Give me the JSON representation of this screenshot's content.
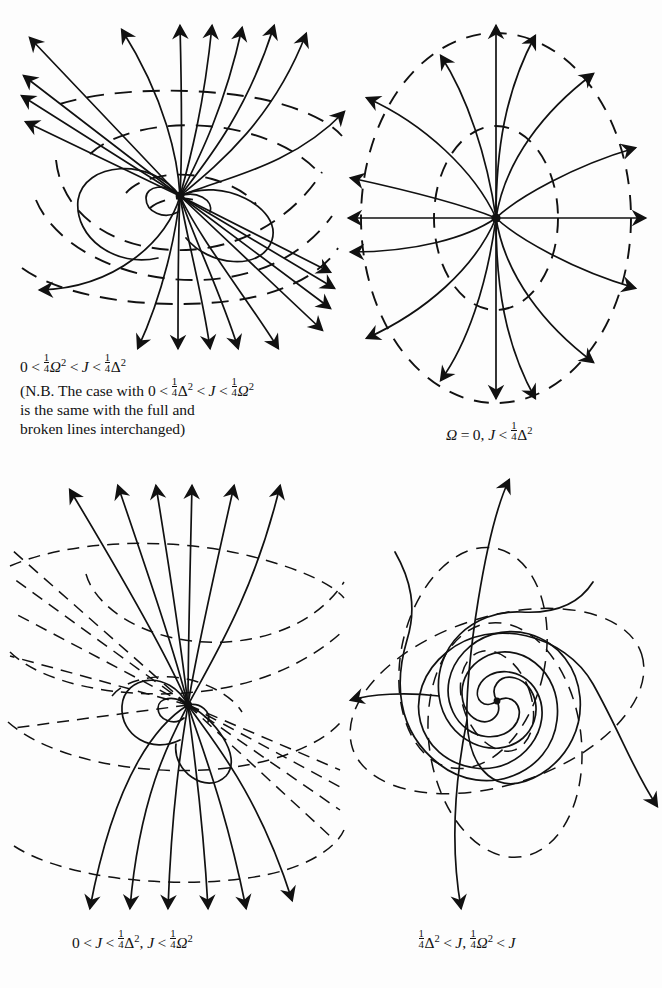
{
  "figure": {
    "kind": "phase-portrait-plate",
    "background": "#fdfdfd",
    "ink": "#111111",
    "panel_count": 4
  },
  "panels": [
    {
      "id": "panel-top-left",
      "position": "top-left",
      "portrait_type": "degenerate-node-saddle-like",
      "full_lines": "trajectories",
      "broken_lines": "isoclines/level curves",
      "critical_point": {
        "x": 180,
        "y": 196
      },
      "arrow_count": 16,
      "caption_lines": [
        "0 < ¼Ω² < J < ¼Δ²",
        "(N.B. The case with 0 < ¼Δ² < J < ¼Ω²",
        "is the same with the full and",
        "broken lines interchanged)"
      ]
    },
    {
      "id": "panel-top-right",
      "position": "top-right",
      "portrait_type": "star-node-radial",
      "full_lines": "radial trajectories",
      "broken_lines": "two concentric dashed ellipses",
      "critical_point": {
        "x": 496,
        "y": 218
      },
      "ray_count": 16,
      "dashed_ellipses": 2,
      "caption_lines": [
        "Ω = 0, J < ¼Δ²"
      ]
    },
    {
      "id": "panel-bottom-left",
      "position": "bottom-left",
      "portrait_type": "degenerate-node-interchanged",
      "full_lines": "trajectories",
      "broken_lines": "isoclines/level curves",
      "critical_point": {
        "x": 188,
        "y": 705
      },
      "arrow_count": 13,
      "caption_lines": [
        "0 < J < ¼Δ², J < ¼Ω²"
      ]
    },
    {
      "id": "panel-bottom-right",
      "position": "bottom-right",
      "portrait_type": "unstable-spiral-focus",
      "full_lines": "outward spiral trajectories",
      "broken_lines": "three rotated dashed ellipses",
      "critical_point": {
        "x": 497,
        "y": 700
      },
      "spiral_arms": 4,
      "dashed_ellipses": 3,
      "caption_lines": [
        "¼Δ² < J, ¼Ω² < J"
      ]
    }
  ],
  "captions": {
    "panel1": {
      "line1": {
        "zero": "0",
        "lt1": "<",
        "quarter1": "¼",
        "omega": "Ω",
        "sq1": "2",
        "lt2": "<",
        "J": "J",
        "lt3": "<",
        "quarter2": "¼",
        "delta": "Δ",
        "sq2": "2"
      },
      "line2_prefix": "(N.B. The case with",
      "line2": {
        "zero": "0",
        "lt1": "<",
        "quarter1": "¼",
        "delta": "Δ",
        "sq1": "2",
        "lt2": "<",
        "J": "J",
        "lt3": "<",
        "quarter2": "¼",
        "omega": "Ω",
        "sq2": "2"
      },
      "line3": "is the same with the full and",
      "line4": "broken lines interchanged)"
    },
    "panel2": {
      "omega": "Ω",
      "eq": "=",
      "zero": "0,",
      "J": "J",
      "lt": "<",
      "quarter": "¼",
      "delta": "Δ",
      "sq": "2"
    },
    "panel3": {
      "zero": "0",
      "lt1": "<",
      "J1": "J",
      "lt2": "<",
      "quarter1": "¼",
      "delta": "Δ",
      "sq1": "2",
      "comma": ",",
      "J2": "J",
      "lt3": "<",
      "quarter2": "¼",
      "omega": "Ω",
      "sq2": "2"
    },
    "panel4": {
      "quarter1": "¼",
      "delta": "Δ",
      "sq1": "2",
      "lt1": "<",
      "J1": "J",
      "comma": ",",
      "quarter2": "¼",
      "omega": "Ω",
      "sq2": "2",
      "lt2": "<",
      "J2": "J"
    }
  },
  "glyphs": {
    "numerator": "1",
    "denominator": "4",
    "exponent": "2"
  }
}
